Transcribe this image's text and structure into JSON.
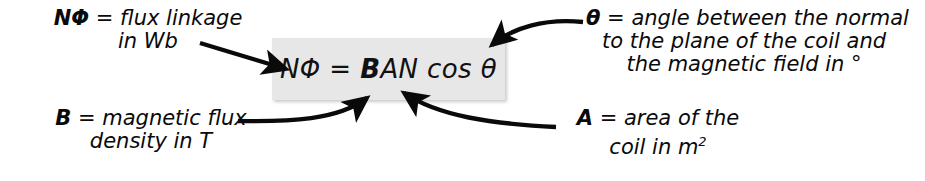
{
  "figure": {
    "background_color": "#ffffff",
    "box_color": "#e7e7e7",
    "ink_color": "#0a0a0a"
  },
  "formula": {
    "full_text": "NΦ = BAN cos θ",
    "lhs": "NΦ",
    "equals": "=",
    "bold_term": "B",
    "rest": "AN",
    "cos": "cos",
    "angle": "θ"
  },
  "annotations": {
    "flux_linkage": {
      "symbol": "NΦ",
      "equals": "=",
      "line1": "flux linkage",
      "line2": "in Wb"
    },
    "theta": {
      "symbol": "θ",
      "equals": "=",
      "line1": "angle between the normal",
      "line2": "to the plane of the coil and",
      "line3": "the magnetic field in °"
    },
    "flux_density": {
      "symbol": "B",
      "equals": "=",
      "line1": "magnetic flux",
      "line2": "density in T"
    },
    "area": {
      "symbol": "A",
      "equals": "=",
      "line1": "area of the",
      "line2": "coil in m",
      "exponent": "2"
    }
  }
}
